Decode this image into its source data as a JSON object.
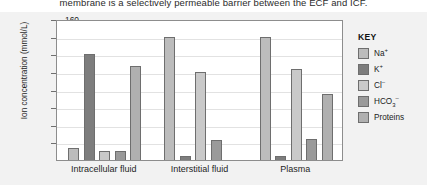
{
  "body_text": {
    "truncated_line": "membrane is a selectively permeable barrier between the ECF and ICF."
  },
  "legend": {
    "title": "KEY",
    "entries": [
      {
        "label": "Na+",
        "html": "Na<sup>+</sup>",
        "color": "#bcbcbc"
      },
      {
        "label": "K+",
        "html": "K<sup>+</sup>",
        "color": "#7d7d7d"
      },
      {
        "label": "Cl-",
        "html": "Cl<sup>–</sup>",
        "color": "#c9c9c9"
      },
      {
        "label": "HCO3-",
        "html": "HCO<sub>3</sub><sup>–</sup>",
        "color": "#9a9a9a"
      },
      {
        "label": "Proteins",
        "html": "Proteins",
        "color": "#b0b0b0"
      }
    ]
  },
  "chart_data": {
    "type": "bar",
    "title": "",
    "xlabel": "",
    "ylabel": "Ion concentration (mmol/L)",
    "ylim": [
      0,
      160
    ],
    "ytick_step": 20,
    "yticks": [
      20,
      40,
      60,
      80,
      100,
      120,
      140,
      160
    ],
    "ytick_labels": [
      "20",
      "40",
      "60",
      "80",
      "100",
      "120",
      "140",
      "160"
    ],
    "grid": true,
    "legend_position": "right",
    "categories": [
      "Intracellular fluid",
      "Interstitial fluid",
      "Plasma"
    ],
    "series": [
      {
        "name": "Na+",
        "color": "#bcbcbc",
        "values": [
          14,
          140,
          140
        ]
      },
      {
        "name": "K+",
        "color": "#7d7d7d",
        "values": [
          120,
          5,
          5
        ]
      },
      {
        "name": "Cl-",
        "color": "#c9c9c9",
        "values": [
          10,
          100,
          103
        ]
      },
      {
        "name": "HCO3-",
        "color": "#9a9a9a",
        "values": [
          10,
          23,
          24
        ]
      },
      {
        "name": "Proteins",
        "color": "#b0b0b0",
        "values": [
          107,
          0,
          75
        ]
      }
    ]
  }
}
